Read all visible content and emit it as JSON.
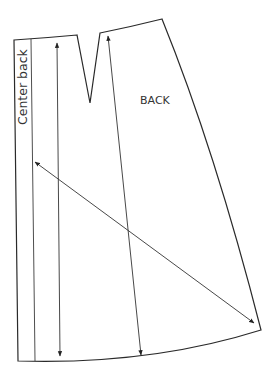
{
  "diagram": {
    "type": "sewing-pattern-piece",
    "piece_label": "BACK",
    "edge_label": "Center back",
    "colors": {
      "line": "#2a2a2a",
      "text": "#333333",
      "background": "#ffffff"
    },
    "elements": [
      {
        "name": "pattern-outline",
        "kind": "closed-shape",
        "includes": [
          "waistline",
          "dart",
          "side-seam",
          "hemline",
          "center-back-edge"
        ]
      },
      {
        "name": "center-back-fold-line",
        "kind": "line"
      },
      {
        "name": "grainline-arrow-left",
        "kind": "double-arrow",
        "orientation": "vertical"
      },
      {
        "name": "grainline-arrow-right",
        "kind": "double-arrow",
        "orientation": "vertical"
      },
      {
        "name": "bias-arrow",
        "kind": "double-arrow",
        "orientation": "diagonal"
      }
    ]
  }
}
